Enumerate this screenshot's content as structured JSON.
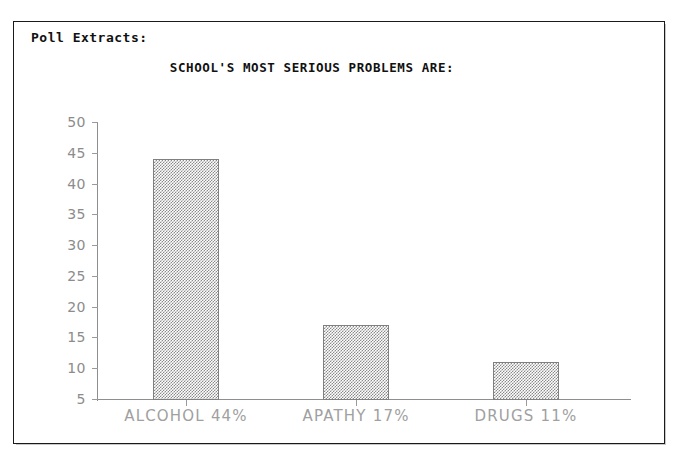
{
  "header": {
    "poll_label": "Poll Extracts:"
  },
  "chart_data": {
    "type": "bar",
    "title": "SCHOOL'S MOST SERIOUS PROBLEMS ARE:",
    "xlabel": "",
    "ylabel": "",
    "categories": [
      "ALCOHOL",
      "APATHY",
      "DRUGS"
    ],
    "values": [
      44,
      17,
      11
    ],
    "value_labels": [
      "44%",
      "17%",
      "11%"
    ],
    "tick_labels": [
      "ALCOHOL  44%",
      "APATHY  17%",
      "DRUGS  11%"
    ],
    "ylim": [
      5,
      50
    ],
    "y_ticks": [
      50,
      45,
      40,
      35,
      30,
      25,
      20,
      15,
      10,
      5
    ],
    "y_tick_labels": [
      "50",
      "45",
      "40",
      "35",
      "30",
      "25",
      "20",
      "15",
      "10",
      "5"
    ],
    "grid": false,
    "legend": null,
    "bar_fill": "checkerboard-dither-gray",
    "bar_edge_color": "#808080",
    "axis_color": "#8e8e8e",
    "label_color": "#a0a0a0",
    "baseline": 5
  }
}
